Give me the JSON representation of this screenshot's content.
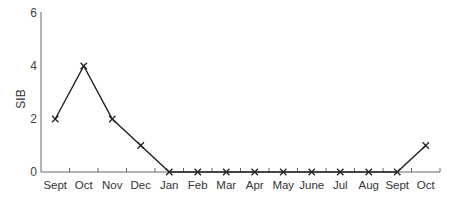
{
  "chart_data": {
    "type": "line",
    "title": "",
    "xlabel": "",
    "ylabel": "SIB",
    "categories": [
      "Sept",
      "Oct",
      "Nov",
      "Dec",
      "Jan",
      "Feb",
      "Mar",
      "Apr",
      "May",
      "June",
      "Jul",
      "Aug",
      "Sept",
      "Oct"
    ],
    "series": [
      {
        "name": "SIB",
        "values": [
          2,
          4,
          2,
          1,
          0,
          0,
          0,
          0,
          0,
          0,
          0,
          0,
          0,
          1
        ],
        "marker": "x",
        "color": "#222222"
      }
    ],
    "yticks": [
      "0",
      "2",
      "4",
      "6"
    ],
    "ylim": [
      0,
      6
    ],
    "grid": false,
    "legend": null
  }
}
